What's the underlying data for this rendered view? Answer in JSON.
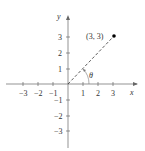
{
  "axes": {
    "x_label": "x",
    "y_label": "y",
    "x_ticks": [
      "−3",
      "−2",
      "−1",
      "1",
      "2",
      "3"
    ],
    "y_ticks_pos": [
      "1",
      "2",
      "3"
    ],
    "y_ticks_neg": [
      "−1",
      "−2",
      "−3"
    ]
  },
  "point": {
    "label": "(3, 3)",
    "x": 3,
    "y": 3
  },
  "angle": {
    "label": "θ"
  },
  "colors": {
    "axis": "#555555",
    "line": "#333333",
    "point": "#000000"
  }
}
